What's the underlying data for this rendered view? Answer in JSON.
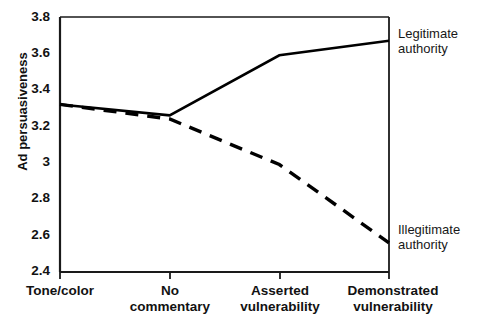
{
  "chart_data": {
    "type": "line",
    "title": "",
    "xlabel": "",
    "ylabel": "Ad persuasiveness",
    "ylim": [
      2.4,
      3.8
    ],
    "yticks": [
      2.4,
      2.6,
      2.8,
      3.0,
      3.2,
      3.4,
      3.6,
      3.8
    ],
    "ytick_labels": [
      "2.4",
      "2.6",
      "2.8",
      "3",
      "3.2",
      "3.4",
      "3.6",
      "3.8"
    ],
    "grid": false,
    "legend_position": "right-of-axes-inline",
    "categories": [
      "Tone/color",
      "No commentary",
      "Asserted vulnerability",
      "Demonstrated vulnerability"
    ],
    "category_labels_wrapped": [
      "Tone/color",
      "No\ncommentary",
      "Asserted\nvulnerability",
      "Demonstrated\nvulnerability"
    ],
    "series": [
      {
        "name": "Legitimate authority",
        "name_wrapped": "Legitimate\nauthority",
        "style": "solid",
        "color": "#000000",
        "values": [
          3.32,
          3.26,
          3.59,
          3.67
        ]
      },
      {
        "name": "Illegitimate authority",
        "name_wrapped": "Illegitimate\nauthority",
        "style": "dashed",
        "color": "#000000",
        "values": [
          3.32,
          3.24,
          2.99,
          2.56
        ]
      }
    ]
  }
}
